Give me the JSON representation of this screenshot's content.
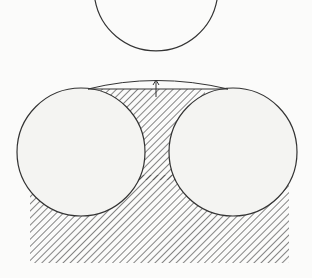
{
  "diagram": {
    "colors": {
      "stroke": "#333333",
      "background": "#fbfbfa",
      "circle_fill": "#f4f4f2",
      "hatch": "#333333"
    },
    "top_circle": {
      "cx": 156,
      "cy": 18,
      "r": 62
    },
    "left_circle": {
      "cx": 81,
      "cy": 152,
      "r": 64
    },
    "right_circle": {
      "cx": 233,
      "cy": 152,
      "r": 64
    },
    "arrow": {
      "x": 156,
      "y1": 97,
      "y2": 81
    }
  }
}
